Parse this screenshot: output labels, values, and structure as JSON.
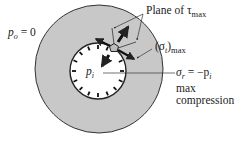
{
  "diagram": {
    "type": "thick-walled cylinder stress diagram",
    "colors": {
      "wall_fill": "#c8c8c8",
      "bore_fill": "#ffffff",
      "stroke": "#222222",
      "background": "#ffffff"
    },
    "geometry": {
      "outer_circle": {
        "cx": 99,
        "cy": 69,
        "r": 64
      },
      "inner_circle": {
        "cx": 98,
        "cy": 71,
        "r": 28
      },
      "element": {
        "cx": 114,
        "cy": 48,
        "r": 4
      }
    },
    "labels": {
      "outer_pressure": {
        "symbol": "p",
        "subscript": "o",
        "rest": " = 0"
      },
      "inner_pressure": {
        "symbol": "p",
        "subscript": "i"
      },
      "plane_label_text": "Plane of ",
      "plane_label_symbol": "τ",
      "plane_label_subscript": "max",
      "hoop_stress_symbol": "(σ",
      "hoop_stress_subscript": "t",
      "hoop_stress_close": ")",
      "hoop_stress_outer_subscript": "max",
      "radial_stress_symbol": "σ",
      "radial_stress_subscript": "r",
      "radial_stress_rest": " = −p",
      "radial_stress_rest_subscript": "i",
      "max_line1": "max",
      "max_line2": "compression"
    }
  }
}
